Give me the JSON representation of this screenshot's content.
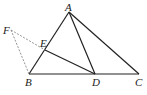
{
  "diagram": {
    "type": "geometry",
    "points": {
      "A": {
        "label": "A",
        "x": 69,
        "y": 12
      },
      "B": {
        "label": "B",
        "x": 29,
        "y": 74
      },
      "C": {
        "label": "C",
        "x": 139,
        "y": 74
      },
      "D": {
        "label": "D",
        "x": 95,
        "y": 74
      },
      "E": {
        "label": "E",
        "x": 45,
        "y": 50
      },
      "F": {
        "label": "F",
        "x": 11,
        "y": 30
      }
    },
    "solid_segments": [
      "AB",
      "AC",
      "BC",
      "AD",
      "ED"
    ],
    "dashed_segments": [
      "FE",
      "FB"
    ],
    "colors": {
      "line": "#222222",
      "dashed": "#777777"
    }
  }
}
